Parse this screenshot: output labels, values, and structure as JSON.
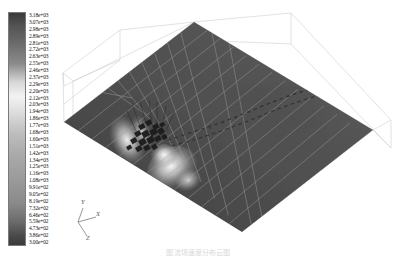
{
  "figure": {
    "background_color": "#ffffff"
  },
  "caption": {
    "text": "图  流场速度分布云图"
  },
  "colorbar": {
    "name": "contour-colorbar",
    "orientation": "vertical",
    "colormap": "grayscale",
    "border_color": "#7a7a7a",
    "max_label": "3.18e+03",
    "min_label": "3.00e+02",
    "max_value": 3180,
    "min_value": 300,
    "labels": [
      "3.18e+03",
      "3.07e+03",
      "2.98e+03",
      "2.89e+03",
      "2.81e+03",
      "2.72e+03",
      "2.63e+03",
      "2.55e+03",
      "2.46e+03",
      "2.37e+03",
      "2.29e+03",
      "2.20e+03",
      "2.12e+03",
      "2.03e+03",
      "1.94e+03",
      "1.86e+03",
      "1.77e+03",
      "1.68e+03",
      "1.60e+03",
      "1.51e+03",
      "1.42e+03",
      "1.34e+03",
      "1.25e+03",
      "1.16e+03",
      "1.08e+03",
      "9.91e+02",
      "9.05e+02",
      "8.19e+02",
      "7.32e+02",
      "6.46e+02",
      "5.59e+02",
      "4.73e+02",
      "3.86e+02",
      "3.00e+02"
    ],
    "values": [
      3180,
      3070,
      2980,
      2890,
      2810,
      2720,
      2630,
      2550,
      2460,
      2370,
      2290,
      2200,
      2120,
      2030,
      1940,
      1860,
      1770,
      1680,
      1600,
      1510,
      1420,
      1340,
      1250,
      1160,
      1080,
      991,
      905,
      819,
      732,
      646,
      559,
      473,
      386,
      300
    ],
    "gradient_stops": [
      {
        "pos": 0,
        "color": "#3a3a3a"
      },
      {
        "pos": 6,
        "color": "#555555"
      },
      {
        "pos": 14,
        "color": "#6e6e6e"
      },
      {
        "pos": 22,
        "color": "#8c8c8c"
      },
      {
        "pos": 30,
        "color": "#d8d8d8"
      },
      {
        "pos": 36,
        "color": "#f2f2f2"
      },
      {
        "pos": 42,
        "color": "#e0e0e0"
      },
      {
        "pos": 52,
        "color": "#bdbdbd"
      },
      {
        "pos": 62,
        "color": "#a8a8a8"
      },
      {
        "pos": 72,
        "color": "#9a9a9a"
      },
      {
        "pos": 82,
        "color": "#8a8a8a"
      },
      {
        "pos": 90,
        "color": "#6b6b6b"
      },
      {
        "pos": 96,
        "color": "#4a4a4a"
      },
      {
        "pos": 100,
        "color": "#3b3b3b"
      }
    ]
  },
  "axes": {
    "name": "axis-triad",
    "color": "#5a5a5a",
    "x_label": "X",
    "y_label": "Y",
    "z_label": "Z"
  },
  "scene": {
    "name": "contour-scene",
    "surface_fill_dark": "#4a4a4a",
    "surface_fill_mid": "#5a5a5a",
    "grid_line_color": "#9e9e9e",
    "wireframe_color": "#c9c9c9",
    "obstacle_color": "#1a1a1a",
    "plume_color": "#ececec"
  },
  "chart_data": {
    "type": "heatmap",
    "subtitle": "",
    "xlabel": "X",
    "ylabel": "Y",
    "zlabel": "Z",
    "colormap": "grayscale",
    "colorbar_label": "",
    "colorbar_range": [
      300,
      3180
    ],
    "legend_position": "left",
    "grid": true,
    "projection": "3d-oblique",
    "tick_labels": [
      "3.18e+03",
      "3.07e+03",
      "2.98e+03",
      "2.89e+03",
      "2.81e+03",
      "2.72e+03",
      "2.63e+03",
      "2.55e+03",
      "2.46e+03",
      "2.37e+03",
      "2.29e+03",
      "2.20e+03",
      "2.12e+03",
      "2.03e+03",
      "1.94e+03",
      "1.86e+03",
      "1.77e+03",
      "1.68e+03",
      "1.60e+03",
      "1.51e+03",
      "1.42e+03",
      "1.34e+03",
      "1.25e+03",
      "1.16e+03",
      "1.08e+03",
      "9.91e+02",
      "9.05e+02",
      "8.19e+02",
      "7.32e+02",
      "6.46e+02",
      "5.59e+02",
      "4.73e+02",
      "3.86e+02",
      "3.00e+02"
    ],
    "tick_values": [
      3180,
      3070,
      2980,
      2890,
      2810,
      2720,
      2630,
      2550,
      2460,
      2370,
      2290,
      2200,
      2120,
      2030,
      1940,
      1860,
      1770,
      1680,
      1600,
      1510,
      1420,
      1340,
      1250,
      1160,
      1080,
      991,
      905,
      819,
      732,
      646,
      559,
      473,
      386,
      300
    ],
    "n_levels": 34,
    "features": [
      {
        "name": "background-field",
        "value": 700,
        "description": "uniform dark mid-gray field over most of the ground plane"
      },
      {
        "name": "obstacle-cluster",
        "value": 300,
        "description": "dense dark obstacle/building cluster at left-center"
      },
      {
        "name": "plume-upstream",
        "value": 3180,
        "description": "bright high-value plume to the left of the obstacle"
      },
      {
        "name": "plume-downstream",
        "value": 3000,
        "description": "bright high-value plume below/right of the obstacle"
      },
      {
        "name": "wake-trail",
        "value": 500,
        "description": "dark dotted wake trail extending right across the domain"
      }
    ],
    "grid_rows": 9,
    "grid_cols": 13
  }
}
